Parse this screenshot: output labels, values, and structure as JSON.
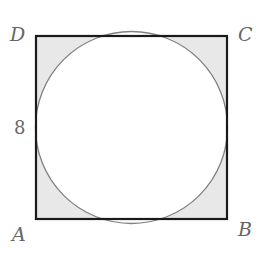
{
  "figure": {
    "shape": "square with inscribed circle",
    "vertices": {
      "top_left": "D",
      "top_right": "C",
      "bottom_left": "A",
      "bottom_right": "B"
    },
    "side_label": "8",
    "shaded_region": "area inside square, outside circle",
    "colors": {
      "square_stroke": "#1a1a1a",
      "circle_stroke": "#777777",
      "shade_fill": "#e8e8e8",
      "label": "#666666"
    }
  }
}
